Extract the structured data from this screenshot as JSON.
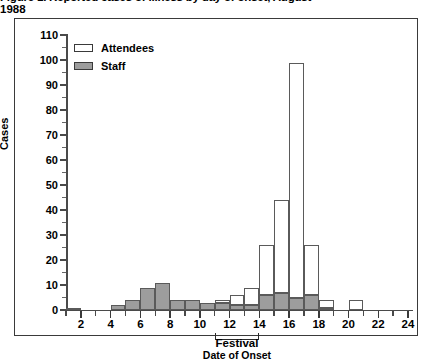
{
  "title": {
    "line1": "Figure 1. Reported cases of illness by day of onset, August",
    "line2": "1988"
  },
  "chart_data": {
    "type": "bar",
    "xlabel": "Date of Onset",
    "ylabel": "Cases",
    "ylim": [
      0,
      110
    ],
    "ytick_values": [
      0,
      10,
      20,
      30,
      40,
      50,
      60,
      70,
      80,
      90,
      100,
      110
    ],
    "ytick_labels": [
      "0",
      "10",
      "20",
      "30",
      "40",
      "50",
      "60",
      "70",
      "80",
      "90",
      "100",
      "110"
    ],
    "xlim": [
      1,
      24
    ],
    "xtick_values": [
      2,
      4,
      6,
      8,
      10,
      12,
      14,
      16,
      18,
      20,
      22,
      24
    ],
    "xtick_labels": [
      "2",
      "4",
      "6",
      "8",
      "10",
      "12",
      "14",
      "16",
      "18",
      "20",
      "22",
      "24"
    ],
    "grid": false,
    "stacked": true,
    "legend_position": "upper left",
    "x": [
      1,
      2,
      3,
      4,
      5,
      6,
      7,
      8,
      9,
      10,
      11,
      12,
      13,
      14,
      15,
      16,
      17,
      18,
      19,
      20,
      21,
      22,
      23
    ],
    "series": [
      {
        "name": "Attendees",
        "color": "#ffffff",
        "values": [
          0,
          0,
          0,
          0,
          0,
          0,
          0,
          0,
          0,
          0,
          1,
          4,
          7,
          20,
          37,
          94,
          20,
          3,
          0,
          4,
          0,
          0,
          0
        ]
      },
      {
        "name": "Staff",
        "color": "#9d9d9d",
        "values": [
          1,
          0,
          0,
          2,
          4,
          9,
          11,
          4,
          4,
          3,
          3,
          2,
          2,
          6,
          7,
          5,
          6,
          1,
          0,
          0,
          0,
          0,
          0
        ]
      }
    ],
    "totals": [
      1,
      0,
      0,
      2,
      4,
      9,
      11,
      4,
      4,
      3,
      4,
      6,
      9,
      26,
      44,
      99,
      26,
      4,
      0,
      4,
      0,
      0,
      0
    ],
    "annotations": [
      {
        "label": "Festival",
        "type": "bracket",
        "x_start": 11,
        "x_end": 14
      }
    ]
  },
  "legend": {
    "items": [
      {
        "label": "Attendees",
        "swatch": "open-rect-swatch"
      },
      {
        "label": "Staff",
        "swatch": "filled-rect-swatch"
      }
    ]
  },
  "festival": {
    "label": "Festival"
  }
}
